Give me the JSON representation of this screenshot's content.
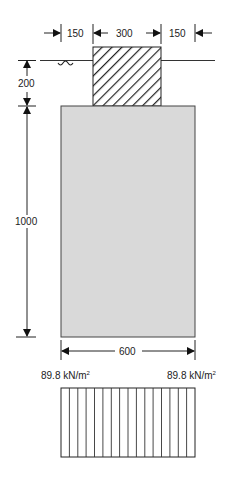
{
  "diagram": {
    "type": "pad-footing-section",
    "top_dimensions": [
      {
        "label": "150",
        "role": "left-offset"
      },
      {
        "label": "300",
        "role": "column-width"
      },
      {
        "label": "150",
        "role": "right-offset"
      }
    ],
    "left_dimensions": [
      {
        "label": "200",
        "role": "depth-to-footing"
      },
      {
        "label": "1000",
        "role": "footing-depth"
      }
    ],
    "bottom_dimension": {
      "label": "600",
      "role": "footing-width"
    },
    "pressure": {
      "left_value": "89.8 kN/m",
      "left_exp": "2",
      "right_value": "89.8 kN/m",
      "right_exp": "2",
      "distribution": "uniform"
    },
    "colors": {
      "footing_fill": "#d9d9d9",
      "line": "#222222",
      "hatch": "#222222",
      "background": "#ffffff"
    },
    "symbols": {
      "water_table": "wave-icon",
      "column_hatch": "diagonal-hatch"
    }
  }
}
